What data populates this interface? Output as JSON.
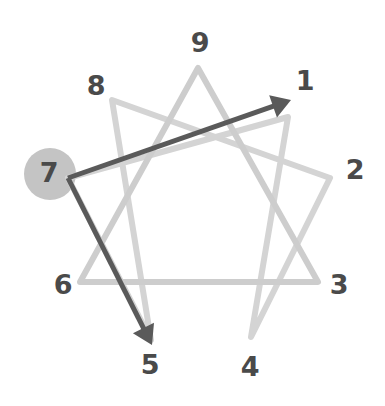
{
  "diagram": {
    "type": "enneagram",
    "canvas": {
      "width": 385,
      "height": 406
    },
    "center": {
      "x": 199,
      "y": 206
    },
    "radius": 138,
    "colors": {
      "background": "#ffffff",
      "figure_light": "#cdcdcd",
      "figure_light_alt": "#d4d4d4",
      "arrow_dark": "#5a5a5a",
      "label": "#4a4a4a",
      "highlight_circle": "#c4c4c4"
    },
    "stroke_widths": {
      "figure": 6,
      "arrow": 5
    }
  },
  "points": [
    {
      "id": "1",
      "label": "1",
      "vertex": {
        "x": 288,
        "y": 117
      },
      "label_pos": {
        "x": 305,
        "y": 81
      }
    },
    {
      "id": "2",
      "label": "2",
      "vertex": {
        "x": 330,
        "y": 178
      },
      "label_pos": {
        "x": 355,
        "y": 170
      }
    },
    {
      "id": "3",
      "label": "3",
      "vertex": {
        "x": 318,
        "y": 282
      },
      "label_pos": {
        "x": 339,
        "y": 285
      }
    },
    {
      "id": "4",
      "label": "4",
      "vertex": {
        "x": 251,
        "y": 337
      },
      "label_pos": {
        "x": 250,
        "y": 367
      }
    },
    {
      "id": "5",
      "label": "5",
      "vertex": {
        "x": 151,
        "y": 340
      },
      "label_pos": {
        "x": 150,
        "y": 365
      }
    },
    {
      "id": "6",
      "label": "6",
      "vertex": {
        "x": 80,
        "y": 282
      },
      "label_pos": {
        "x": 63,
        "y": 285
      }
    },
    {
      "id": "7",
      "label": "7",
      "vertex": {
        "x": 68,
        "y": 178
      },
      "label_pos": {
        "x": 49,
        "y": 173
      }
    },
    {
      "id": "8",
      "label": "8",
      "vertex": {
        "x": 112,
        "y": 100
      },
      "label_pos": {
        "x": 96,
        "y": 86
      }
    },
    {
      "id": "9",
      "label": "9",
      "vertex": {
        "x": 198,
        "y": 68
      },
      "label_pos": {
        "x": 200,
        "y": 43
      }
    }
  ],
  "figure_paths": {
    "triangle": {
      "name": "inner-triangle-9-3-6",
      "sequence": [
        "9",
        "3",
        "6"
      ],
      "closed": true,
      "d": "M 198 68 L 318 282 L 80 282 Z"
    },
    "hexad": {
      "name": "hexad-1-4-2-8-5-7",
      "sequence": [
        "1",
        "4",
        "2",
        "8",
        "5",
        "7"
      ],
      "closed": true,
      "d": "M 288 117 L 251 337 L 330 178 L 112 100 L 151 340 L 68 178 Z"
    }
  },
  "arrows": [
    {
      "name": "arrow-7-to-1",
      "from": "7",
      "to": "1",
      "start": {
        "x": 68,
        "y": 178
      },
      "end": {
        "x": 291,
        "y": 100
      },
      "head_size": 19
    },
    {
      "name": "arrow-7-to-5",
      "from": "7",
      "to": "5",
      "start": {
        "x": 68,
        "y": 178
      },
      "end": {
        "x": 152,
        "y": 345
      },
      "head_size": 19
    }
  ],
  "highlight": {
    "name": "highlighted-point-7",
    "point_id": "7",
    "label": "7",
    "center": {
      "x": 50,
      "y": 174
    },
    "radius": 26,
    "fill": "#c4c4c4"
  }
}
